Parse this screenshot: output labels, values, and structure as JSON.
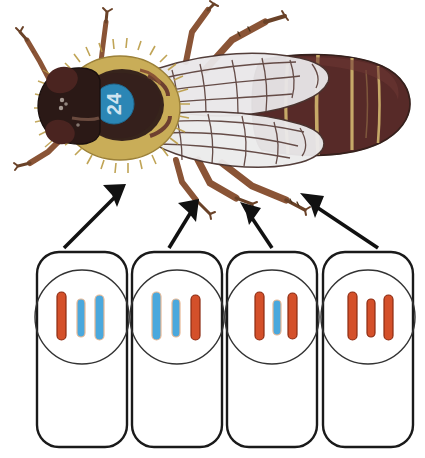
{
  "figure": {
    "specimen_label": "24",
    "specimen_label_color": "#2b86b5",
    "organism": "fly",
    "arrow_count": 4,
    "arrow_color": "#111111"
  },
  "colors": {
    "chromosome_red": "#d4502a",
    "chromosome_blue": "#4aa8dd",
    "chromosome_outline_red": "#8c2b12",
    "chromosome_outline_blue": "#2f7fb0",
    "chromosome_halo": "#f0c8a8",
    "cell_outline": "#1a1a1a",
    "nucleus_outline": "#333333",
    "background": "#ffffff",
    "body_dark": "#3b2320",
    "body_maroon": "#5e2d2a",
    "thorax_gold": "#cdb25c",
    "wing_fill": "#e6e4e6",
    "wing_vein": "#4a3430",
    "leg_brown": "#8a5436"
  },
  "cells": [
    {
      "name": "cell-1",
      "chromosomes": [
        {
          "id": "chr-1a",
          "color": "red",
          "height": 48,
          "x": 61
        },
        {
          "id": "chr-1b",
          "color": "blue",
          "height": 38,
          "x": 76
        },
        {
          "id": "chr-1c",
          "color": "blue",
          "height": 44,
          "x": 91
        }
      ]
    },
    {
      "name": "cell-2",
      "chromosomes": [
        {
          "id": "chr-2a",
          "color": "blue",
          "height": 48,
          "x": 156
        },
        {
          "id": "chr-2b",
          "color": "blue",
          "height": 38,
          "x": 171
        },
        {
          "id": "chr-2c",
          "color": "red",
          "height": 44,
          "x": 189
        }
      ]
    },
    {
      "name": "cell-3",
      "chromosomes": [
        {
          "id": "chr-3a",
          "color": "red",
          "height": 48,
          "x": 259
        },
        {
          "id": "chr-3b",
          "color": "blue",
          "height": 35,
          "x": 275
        },
        {
          "id": "chr-3c",
          "color": "red",
          "height": 45,
          "x": 291
        }
      ]
    },
    {
      "name": "cell-4",
      "chromosomes": [
        {
          "id": "chr-4a",
          "color": "red",
          "height": 48,
          "x": 352
        },
        {
          "id": "chr-4b",
          "color": "red",
          "height": 38,
          "x": 369
        },
        {
          "id": "chr-4c",
          "color": "red",
          "height": 44,
          "x": 386
        }
      ]
    }
  ]
}
